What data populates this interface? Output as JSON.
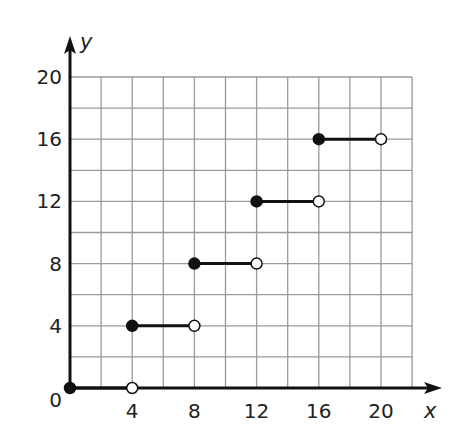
{
  "chart_data": {
    "type": "line",
    "subtype": "step-function",
    "title": "",
    "xlabel": "x",
    "ylabel": "y",
    "xlim": [
      0,
      22
    ],
    "ylim": [
      0,
      20
    ],
    "grid": true,
    "grid_step": 2,
    "x_ticks": [
      4,
      8,
      12,
      16,
      20
    ],
    "y_ticks": [
      0,
      4,
      8,
      12,
      16,
      20
    ],
    "x_tick_labels": [
      "4",
      "8",
      "12",
      "16",
      "20"
    ],
    "y_tick_labels": [
      "0",
      "4",
      "8",
      "12",
      "16",
      "20"
    ],
    "segments": [
      {
        "x_start": 0,
        "x_end": 4,
        "y": 0,
        "start_closed": true,
        "end_closed": false
      },
      {
        "x_start": 4,
        "x_end": 8,
        "y": 4,
        "start_closed": true,
        "end_closed": false
      },
      {
        "x_start": 8,
        "x_end": 12,
        "y": 8,
        "start_closed": true,
        "end_closed": false
      },
      {
        "x_start": 12,
        "x_end": 16,
        "y": 12,
        "start_closed": true,
        "end_closed": false
      },
      {
        "x_start": 16,
        "x_end": 20,
        "y": 16,
        "start_closed": true,
        "end_closed": false
      }
    ],
    "legend": null
  },
  "colors": {
    "axis": "#111111",
    "grid": "#9a9a9a",
    "segment": "#111111",
    "open_point_fill": "#ffffff"
  }
}
